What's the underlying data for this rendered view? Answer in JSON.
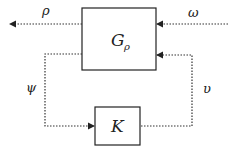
{
  "diagram": {
    "type": "block-diagram",
    "blocks": [
      {
        "id": "G",
        "label": "G",
        "subscript": "ρ"
      },
      {
        "id": "K",
        "label": "K"
      }
    ],
    "signals": [
      {
        "id": "rho",
        "label": "ρ",
        "from": "G",
        "to": "output-left"
      },
      {
        "id": "omega",
        "label": "ω",
        "from": "input-right",
        "to": "G"
      },
      {
        "id": "psi",
        "label": "ψ",
        "from": "G",
        "to": "K"
      },
      {
        "id": "upsilon",
        "label": "υ",
        "from": "K",
        "to": "G"
      }
    ],
    "line_style": "dotted",
    "line_color": "#333333"
  }
}
